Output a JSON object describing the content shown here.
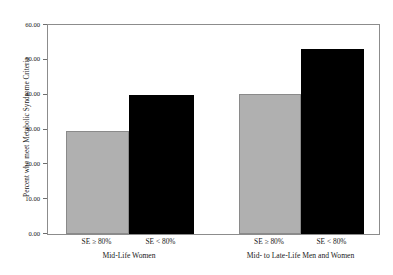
{
  "chart_data": {
    "type": "bar",
    "title": "",
    "subtitle": "",
    "xlabel": "",
    "ylabel": "Percent who meet Metabolic Syndrome Criteria",
    "ylim": [
      0,
      60
    ],
    "yticks": [
      0,
      10,
      20,
      30,
      40,
      50,
      60
    ],
    "ytick_labels": [
      "0.00",
      "10.00",
      "20.00",
      "30.00",
      "40.00",
      "50.00",
      "60.00"
    ],
    "grid": false,
    "legend": null,
    "legend_position": "none",
    "categories": [
      "SE ≥ 80%",
      "SE < 80%"
    ],
    "groups": [
      {
        "name": "Mid-Life Women",
        "bars": [
          {
            "category": "SE ≥ 80%",
            "value": 29.5,
            "color": "#b0b0b0"
          },
          {
            "category": "SE < 80%",
            "value": 40.0,
            "color": "#000000"
          }
        ]
      },
      {
        "name": "Mid- to Late-Life Men and Women",
        "bars": [
          {
            "category": "SE ≥ 80%",
            "value": 40.3,
            "color": "#b0b0b0"
          },
          {
            "category": "SE < 80%",
            "value": 53.2,
            "color": "#000000"
          }
        ]
      }
    ],
    "colors": {
      "bar_gray": "#b0b0b0",
      "bar_black": "#000000",
      "axis": "#8c8c8c",
      "text": "#1a1a1a",
      "background": "#ffffff"
    }
  }
}
